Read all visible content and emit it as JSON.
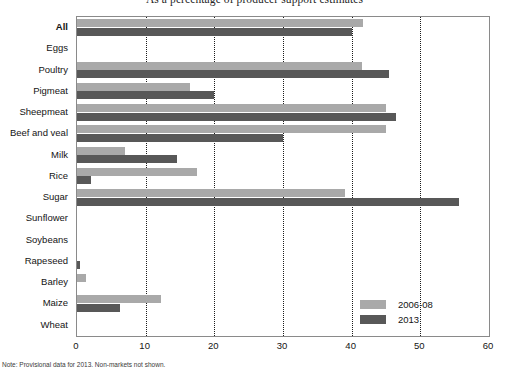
{
  "chart_data": {
    "type": "bar",
    "orientation": "horizontal",
    "title": "As a percentage of producer support estimates",
    "xlabel": "",
    "ylabel": "",
    "xlim": [
      0,
      60
    ],
    "xticks": [
      0,
      10,
      20,
      30,
      40,
      50,
      60
    ],
    "xtick_labels": [
      "0",
      "10",
      "20",
      "30",
      "40",
      "50",
      "60"
    ],
    "grid": "vertical-dotted",
    "legend_position": "inside-lower-center",
    "categories": [
      "All",
      "Eggs",
      "Poultry",
      "Pigmeat",
      "Sheepmeat",
      "Beef and veal",
      "Milk",
      "Rice",
      "Sugar",
      "Sunflower",
      "Soybeans",
      "Rapeseed",
      "Barley",
      "Maize",
      "Wheat"
    ],
    "series": [
      {
        "name": "2006-08",
        "color": "#a9a9a9",
        "values": [
          41.7,
          0,
          41.5,
          16.5,
          45.0,
          45.0,
          7.0,
          17.5,
          39.0,
          0,
          0,
          0,
          1.3,
          12.3,
          0
        ]
      },
      {
        "name": "2013",
        "color": "#585858",
        "values": [
          40.0,
          0,
          45.5,
          20.0,
          46.5,
          30.0,
          14.5,
          2.0,
          55.7,
          0,
          0,
          0.4,
          0,
          6.3,
          0
        ]
      }
    ]
  },
  "footnote": {
    "text": "Note: Provisional data for 2013. Non-markets not shown."
  }
}
